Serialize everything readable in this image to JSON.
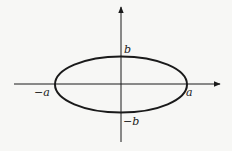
{
  "diagram": {
    "type": "ellipse-on-axes",
    "labels": {
      "b_top": "b",
      "b_bottom": "−b",
      "a_left": "−a",
      "a_right": "a"
    },
    "colors": {
      "stroke": "#1a1a1a",
      "background": "#f7f7f5"
    }
  }
}
